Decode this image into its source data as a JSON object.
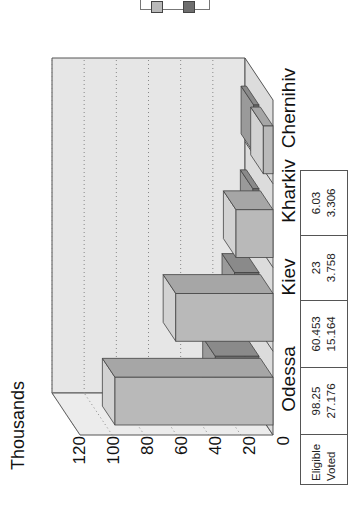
{
  "chart_data": {
    "type": "bar",
    "style": "3d-clustered-column, rotated 90 degrees counter-clockwise",
    "title": "",
    "ylabel": "Thousands",
    "xlabel": "",
    "categories": [
      "Odessa",
      "Kiev",
      "Kharkiv",
      "Chernihiv"
    ],
    "series": [
      {
        "name": "Eligible",
        "values": [
          98.25,
          60.453,
          23,
          6.03
        ],
        "color": "#b9b9b9"
      },
      {
        "name": "Voted",
        "values": [
          27.176,
          15.164,
          3.758,
          3.306
        ],
        "color": "#6e6e6e"
      }
    ],
    "ylim": [
      0,
      120
    ],
    "yticks": [
      "0",
      "20",
      "40",
      "60",
      "80",
      "100",
      "120"
    ],
    "grid": true,
    "legend_position": "top-right (partially cut off)",
    "data_table": true
  },
  "axis": {
    "title": "Thousands",
    "ticks": [
      "120",
      "100",
      "80",
      "60",
      "40",
      "20",
      "0"
    ]
  },
  "categories": [
    "Odessa",
    "Kiev",
    "Kharkiv",
    "Chernihiv"
  ],
  "table": {
    "row_labels": [
      "Eligible",
      "Voted"
    ],
    "columns": [
      {
        "eligible": "98.25",
        "voted": "27.176"
      },
      {
        "eligible": "60.453",
        "voted": "15.164"
      },
      {
        "eligible": "23",
        "voted": "3.758"
      },
      {
        "eligible": "6.03",
        "voted": "3.306"
      }
    ]
  },
  "colors": {
    "wall": "#e6e6e6",
    "floor": "#dcdcdc",
    "eligible_front": "#b9b9b9",
    "eligible_top": "#d2d2d2",
    "eligible_side": "#a6a6a6",
    "voted_front": "#6e6e6e",
    "voted_top": "#9a9a9a",
    "voted_side": "#8a8a8a",
    "outline": "#444444"
  }
}
